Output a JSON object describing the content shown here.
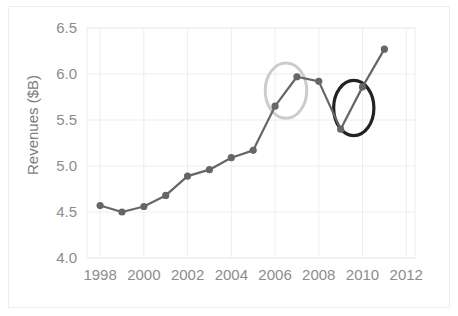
{
  "chart_data": {
    "type": "line",
    "title": "",
    "subtitle": "",
    "xlabel": "",
    "ylabel": "Revenues ($B)",
    "x": [
      1998,
      1999,
      2000,
      2001,
      2002,
      2003,
      2004,
      2005,
      2006,
      2007,
      2008,
      2009,
      2010,
      2011
    ],
    "values": [
      4.57,
      4.5,
      4.56,
      4.68,
      4.89,
      4.96,
      5.09,
      5.17,
      5.65,
      5.97,
      5.92,
      5.4,
      5.86,
      6.27
    ],
    "series": [
      {
        "name": "Revenues",
        "values": [
          4.57,
          4.5,
          4.56,
          4.68,
          4.89,
          4.96,
          5.09,
          5.17,
          5.65,
          5.97,
          5.92,
          5.4,
          5.86,
          6.27
        ]
      }
    ],
    "xlim": [
      1997.4,
      2012.4
    ],
    "ylim": [
      4.0,
      6.5
    ],
    "xticks": [
      1998,
      2000,
      2002,
      2004,
      2006,
      2008,
      2010,
      2012
    ],
    "xtick_labels": [
      "1998",
      "2000",
      "2002",
      "2004",
      "2006",
      "2008",
      "2010",
      "2012"
    ],
    "yticks": [
      4.0,
      4.5,
      5.0,
      5.5,
      6.0,
      6.5
    ],
    "ytick_labels": [
      "4.0",
      "4.5",
      "5.0",
      "5.5",
      "6.0",
      "6.5"
    ],
    "grid": true,
    "legend": "none",
    "line_color": "#666666",
    "marker_color": "#666666",
    "grid_color": "#ededed",
    "annotations": [
      {
        "name": "light-ellipse",
        "shape": "ellipse",
        "color": "#cccccc",
        "x_center": 2006.5,
        "y_center": 5.82,
        "x_radius": 0.95,
        "y_radius": 0.3,
        "covers": [
          2006,
          2007
        ]
      },
      {
        "name": "dark-ellipse",
        "shape": "ellipse",
        "color": "#222222",
        "x_center": 2009.6,
        "y_center": 5.63,
        "x_radius": 0.92,
        "y_radius": 0.3,
        "covers": [
          2009,
          2010
        ]
      }
    ]
  },
  "axes": {
    "y_axis_title": "Revenues ($B)"
  }
}
